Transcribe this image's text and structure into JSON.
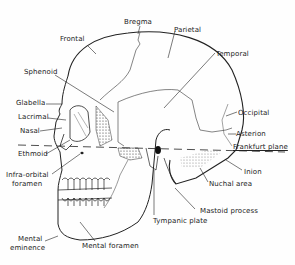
{
  "diagram": {
    "labels": {
      "bregma": "Bregma",
      "frontal": "Frontal",
      "parietal": "Parietal",
      "temporal": "Temporal",
      "sphenoid": "Sphenoid",
      "glabella": "Glabella",
      "lacrimal": "Lacrimal",
      "nasal": "Nasal",
      "ethmoid": "Ethmoid",
      "occipital": "Occipital",
      "asterion": "Asterion",
      "frankfurt_plane": "Frankfurt plane",
      "inion": "Inion",
      "nuchal_area": "Nuchal area",
      "infra_orbital_1": "Infra-orbital",
      "infra_orbital_2": "foramen",
      "mastoid_process": "Mastoid process",
      "tympanic_plate": "Tympanic plate",
      "mental_eminence_1": "Mental",
      "mental_eminence_2": "eminence",
      "mental_foramen": "Mental foramen"
    }
  }
}
